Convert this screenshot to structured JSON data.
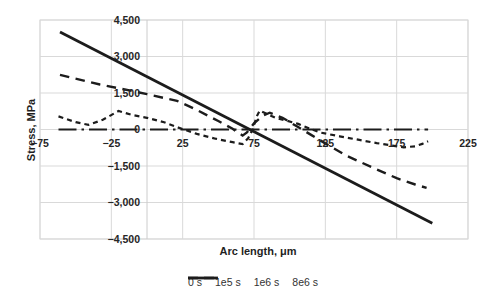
{
  "chart_data": {
    "type": "line",
    "title": "",
    "xlabel": "Arc length, μm",
    "ylabel": "Stress, MPa",
    "xlim": [
      -75,
      225
    ],
    "ylim": [
      -4500,
      4500
    ],
    "grid": true,
    "legend_position": "bottom",
    "x_ticks": [
      -75,
      -25,
      25,
      75,
      125,
      175,
      225
    ],
    "x_tick_labels": [
      "−75",
      "−25",
      "25",
      "75",
      "125",
      "175",
      "225"
    ],
    "y_ticks": [
      4500,
      3000,
      1500,
      0,
      -1500,
      -3000,
      -4500
    ],
    "y_tick_labels": [
      "4,500",
      "3,000",
      "1,500",
      "0",
      "−1,500",
      "−3,000",
      "−4,500"
    ],
    "vertical_axis_at_x": 0,
    "colors": {
      "line": "#1c1c1c",
      "grid": "#d9d9d9",
      "axis": "#cccccc",
      "text": "#262626"
    },
    "series": [
      {
        "name": "0 s",
        "style": "dash-dot",
        "dash": "18 5 2.5 5",
        "legend_dash": "16 5 2.5 99",
        "legend_width": 30,
        "line_width": 2.2,
        "points": [
          [
            -62,
            0
          ],
          [
            197,
            0
          ]
        ]
      },
      {
        "name": "1e5 s",
        "style": "short-dash",
        "dash": "5 4",
        "legend_dash": "5 4",
        "legend_width": 23,
        "line_width": 2.2,
        "points": [
          [
            -62,
            540
          ],
          [
            -50,
            300
          ],
          [
            -41,
            190
          ],
          [
            -31,
            400
          ],
          [
            -20,
            760
          ],
          [
            -10,
            590
          ],
          [
            0,
            480
          ],
          [
            12,
            300
          ],
          [
            22,
            80
          ],
          [
            35,
            -180
          ],
          [
            48,
            -380
          ],
          [
            60,
            -520
          ],
          [
            67,
            -600
          ],
          [
            71,
            -350
          ],
          [
            74,
            0
          ],
          [
            77,
            550
          ],
          [
            79,
            780
          ],
          [
            84,
            640
          ],
          [
            90,
            480
          ],
          [
            98,
            360
          ],
          [
            106,
            230
          ],
          [
            113,
            60
          ],
          [
            121,
            -120
          ],
          [
            135,
            -280
          ],
          [
            148,
            -420
          ],
          [
            161,
            -560
          ],
          [
            172,
            -660
          ],
          [
            180,
            -730
          ],
          [
            188,
            -690
          ],
          [
            193,
            -590
          ],
          [
            197,
            -480
          ]
        ]
      },
      {
        "name": "1e6 s",
        "style": "long-dash",
        "dash": "9.5 6.5",
        "legend_dash": "10 6",
        "legend_width": 26,
        "line_width": 2.4,
        "points": [
          [
            -61,
            2250
          ],
          [
            -33,
            1850
          ],
          [
            -10,
            1580
          ],
          [
            0,
            1450
          ],
          [
            21,
            1180
          ],
          [
            35,
            800
          ],
          [
            50,
            350
          ],
          [
            60,
            30
          ],
          [
            67,
            -250
          ],
          [
            70,
            -120
          ],
          [
            75,
            250
          ],
          [
            81,
            560
          ],
          [
            86,
            690
          ],
          [
            95,
            480
          ],
          [
            105,
            130
          ],
          [
            115,
            -220
          ],
          [
            125,
            -570
          ],
          [
            140,
            -1080
          ],
          [
            158,
            -1560
          ],
          [
            175,
            -2000
          ],
          [
            188,
            -2260
          ],
          [
            196,
            -2400
          ]
        ]
      },
      {
        "name": "8e6 s",
        "style": "solid",
        "dash": "",
        "legend_dash": "",
        "legend_width": 30,
        "line_width": 2.8,
        "points": [
          [
            -61,
            4010
          ],
          [
            200,
            -3850
          ]
        ]
      }
    ]
  }
}
